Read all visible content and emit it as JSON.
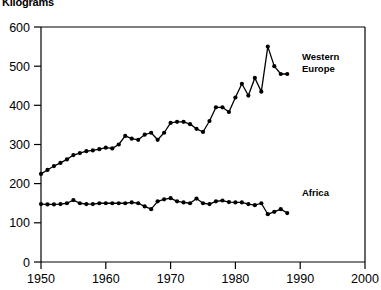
{
  "chart_data": {
    "type": "line",
    "title": "",
    "ylabel": "Kilograms",
    "xlabel": "",
    "xlim": [
      1950,
      2000
    ],
    "ylim": [
      0,
      600
    ],
    "yticks": [
      0,
      100,
      200,
      300,
      400,
      500,
      600
    ],
    "xticks": [
      1950,
      1960,
      1970,
      1980,
      1990,
      2000
    ],
    "grid": false,
    "legend_position": "inline-right",
    "markers": "filled-circle",
    "series": [
      {
        "name": "Western Europe",
        "label_x": 1995,
        "label_y": 505,
        "x": [
          1950,
          1951,
          1952,
          1953,
          1954,
          1955,
          1956,
          1957,
          1958,
          1959,
          1960,
          1961,
          1962,
          1963,
          1964,
          1965,
          1966,
          1967,
          1968,
          1969,
          1970,
          1971,
          1972,
          1973,
          1974,
          1975,
          1976,
          1977,
          1978,
          1979,
          1980,
          1981,
          1982,
          1983,
          1984,
          1985,
          1986,
          1987,
          1988
        ],
        "y": [
          225,
          235,
          245,
          253,
          262,
          273,
          278,
          283,
          285,
          288,
          292,
          290,
          300,
          322,
          315,
          312,
          325,
          330,
          312,
          330,
          355,
          358,
          358,
          352,
          340,
          332,
          360,
          395,
          395,
          383,
          420,
          455,
          425,
          470,
          435,
          550,
          500,
          480,
          480
        ]
      },
      {
        "name": "Africa",
        "label_x": 1995,
        "label_y": 178,
        "x": [
          1950,
          1951,
          1952,
          1953,
          1954,
          1955,
          1956,
          1957,
          1958,
          1959,
          1960,
          1961,
          1962,
          1963,
          1964,
          1965,
          1966,
          1967,
          1968,
          1969,
          1970,
          1971,
          1972,
          1973,
          1974,
          1975,
          1976,
          1977,
          1978,
          1979,
          1980,
          1981,
          1982,
          1983,
          1984,
          1985,
          1986,
          1987,
          1988
        ],
        "y": [
          148,
          147,
          147,
          148,
          150,
          158,
          150,
          148,
          148,
          150,
          150,
          150,
          150,
          150,
          152,
          150,
          142,
          135,
          155,
          160,
          163,
          155,
          152,
          150,
          162,
          150,
          148,
          155,
          157,
          153,
          152,
          152,
          148,
          145,
          150,
          122,
          128,
          135,
          125
        ]
      }
    ]
  },
  "axis": {
    "y_title": "Kilograms",
    "y_tick_labels": [
      "600",
      "500",
      "400",
      "300",
      "200",
      "100",
      "0"
    ],
    "x_tick_labels": [
      "1950",
      "1960",
      "1970",
      "1980",
      "1990",
      "2000"
    ]
  },
  "legend": {
    "western_europe_line1": "Western",
    "western_europe_line2": "Europe",
    "africa": "Africa"
  }
}
